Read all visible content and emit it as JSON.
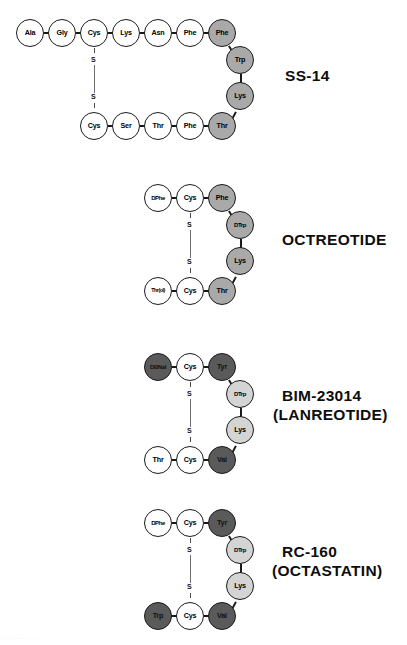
{
  "figure": {
    "shading_legend": {
      "white": "#ffffff",
      "light_gray": "#d4d4d4",
      "mid_gray": "#a9a9a9",
      "dark_gray": "#5a5a5a"
    },
    "bottom_partial_text": "·    ·   ··    ·· ··    ·    ·· ·· ·  ··   ·    ·· ·  ·"
  },
  "panels": [
    {
      "id": "ss14",
      "caption": "SS-14",
      "caption_line2": "",
      "top_row": [
        {
          "label": "Ala",
          "shade": "white"
        },
        {
          "label": "Gly",
          "shade": "white"
        },
        {
          "label": "Cys",
          "shade": "white"
        },
        {
          "label": "Lys",
          "shade": "white"
        },
        {
          "label": "Asn",
          "shade": "white"
        },
        {
          "label": "Phe",
          "shade": "white"
        },
        {
          "label": "Phe",
          "shade": "mid"
        }
      ],
      "right_col": [
        {
          "label": "Trp",
          "shade": "mid"
        },
        {
          "label": "Lys",
          "shade": "mid"
        }
      ],
      "bottom_row": [
        {
          "label": "Cys",
          "shade": "white"
        },
        {
          "label": "Ser",
          "shade": "white"
        },
        {
          "label": "Thr",
          "shade": "white"
        },
        {
          "label": "Phe",
          "shade": "white"
        },
        {
          "label": "Thr",
          "shade": "mid"
        }
      ],
      "bridge": {
        "upper": "S",
        "lower": "S"
      }
    },
    {
      "id": "octreotide",
      "caption": "OCTREOTIDE",
      "caption_line2": "",
      "top_row": [
        {
          "label": "DPhe",
          "shade": "white"
        },
        {
          "label": "Cys",
          "shade": "white"
        },
        {
          "label": "Phe",
          "shade": "mid"
        }
      ],
      "right_col": [
        {
          "label": "DTrp",
          "shade": "mid"
        },
        {
          "label": "Lys",
          "shade": "mid"
        }
      ],
      "bottom_row": [
        {
          "label": "Thr(ol)",
          "shade": "white"
        },
        {
          "label": "Cys",
          "shade": "white"
        },
        {
          "label": "Thr",
          "shade": "mid"
        }
      ],
      "bridge": {
        "upper": "S",
        "lower": "S"
      }
    },
    {
      "id": "bim23014",
      "caption": "BIM-23014",
      "caption_line2": "(LANREOTIDE)",
      "top_row": [
        {
          "label": "DBNal",
          "shade": "dark"
        },
        {
          "label": "Cys",
          "shade": "white"
        },
        {
          "label": "Tyr",
          "shade": "dark"
        }
      ],
      "right_col": [
        {
          "label": "DTrp",
          "shade": "light"
        },
        {
          "label": "Lys",
          "shade": "light"
        }
      ],
      "bottom_row": [
        {
          "label": "Thr",
          "shade": "white"
        },
        {
          "label": "Cys",
          "shade": "white"
        },
        {
          "label": "Val",
          "shade": "dark"
        }
      ],
      "bridge": {
        "upper": "S",
        "lower": "S"
      }
    },
    {
      "id": "rc160",
      "caption": "RC-160",
      "caption_line2": "(OCTASTATIN)",
      "top_row": [
        {
          "label": "DPhe",
          "shade": "white"
        },
        {
          "label": "Cys",
          "shade": "white"
        },
        {
          "label": "Tyr",
          "shade": "dark"
        }
      ],
      "right_col": [
        {
          "label": "DTrp",
          "shade": "light"
        },
        {
          "label": "Lys",
          "shade": "light"
        }
      ],
      "bottom_row": [
        {
          "label": "Trp",
          "shade": "dark"
        },
        {
          "label": "Cys",
          "shade": "white"
        },
        {
          "label": "Val",
          "shade": "dark"
        }
      ],
      "bridge": {
        "upper": "S",
        "lower": "S"
      }
    }
  ]
}
